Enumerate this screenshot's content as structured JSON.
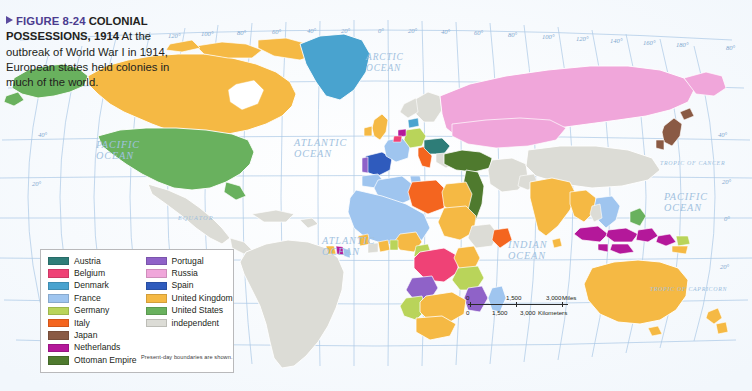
{
  "caption": {
    "figure_marker": "FIGURE 8-24",
    "title": "COLONIAL POSSESSIONS, 1914",
    "body": "At the outbreak of World War I in 1914, European states held colonies in much of the world."
  },
  "legend": {
    "note": "Present-day boundaries are shown.",
    "column_left": [
      {
        "label": "Austria",
        "color": "#2e7d78"
      },
      {
        "label": "Belgium",
        "color": "#ef4276"
      },
      {
        "label": "Denmark",
        "color": "#49a3cf"
      },
      {
        "label": "France",
        "color": "#9fc5ef"
      },
      {
        "label": "Germany",
        "color": "#b9d45a"
      },
      {
        "label": "Italy",
        "color": "#f4651f"
      },
      {
        "label": "Japan",
        "color": "#8a5a44"
      },
      {
        "label": "Netherlands",
        "color": "#b4189a"
      },
      {
        "label": "Ottoman Empire",
        "color": "#4f7a2e"
      }
    ],
    "column_right": [
      {
        "label": "Portugal",
        "color": "#8f62c8"
      },
      {
        "label": "Russia",
        "color": "#f0a6da"
      },
      {
        "label": "Spain",
        "color": "#2f5bbd"
      },
      {
        "label": "United Kingdom",
        "color": "#f5b944"
      },
      {
        "label": "United States",
        "color": "#69b15e"
      },
      {
        "label": "independent",
        "color": "#dcdcd6"
      }
    ]
  },
  "scale_bar": {
    "miles": {
      "ticks": [
        "0",
        "1,500",
        "3,000"
      ],
      "unit": "Miles"
    },
    "kilometers": {
      "ticks": [
        "0",
        "1,500",
        "3,000"
      ],
      "unit": "Kilometers"
    }
  },
  "ocean_labels": [
    {
      "id": "arctic",
      "lines": "ARCTIC OCEAN"
    },
    {
      "id": "pacific_nw",
      "lines": "PACIFIC OCEAN"
    },
    {
      "id": "atlantic_n",
      "lines": "ATLANTIC OCEAN"
    },
    {
      "id": "atlantic_s",
      "lines": "ATLANTIC OCEAN"
    },
    {
      "id": "indian",
      "lines": "INDIAN OCEAN"
    },
    {
      "id": "pacific_se",
      "lines": "PACIFIC OCEAN"
    }
  ],
  "ocean_text": {
    "arctic_l1": "ARCTIC",
    "arctic_l2": "OCEAN",
    "pacific_nw_l1": "PACIFIC",
    "pacific_nw_l2": "OCEAN",
    "atlantic_n_l1": "ATLANTIC",
    "atlantic_n_l2": "OCEAN",
    "atlantic_s_l1": "ATLANTIC",
    "atlantic_s_l2": "OCEAN",
    "indian_l1": "INDIAN",
    "indian_l2": "OCEAN",
    "pacific_se_l1": "PACIFIC",
    "pacific_se_l2": "OCEAN"
  },
  "reference_lines": {
    "equator": "EQUATOR",
    "tropic_cancer": "TROPIC OF CANCER",
    "tropic_capricorn": "TROPIC OF CAPRICORN"
  },
  "graticule": {
    "longitude_top": [
      "140°",
      "120°",
      "100°",
      "80°",
      "60°",
      "40°",
      "20°",
      "0°",
      "20°",
      "40°",
      "60°",
      "80°",
      "100°",
      "120°",
      "140°",
      "160°",
      "180°"
    ],
    "latitude_left": [
      "40°",
      "20°"
    ],
    "latitude_right": [
      "80°",
      "40°",
      "20°",
      "0°",
      "20°"
    ]
  },
  "colors": {
    "ocean_fill": "#ffffff",
    "graticule_line": "#9dc0e2",
    "coast_line": "#ffffff",
    "caption_accent": "#4b3c8f",
    "border_gray": "#b9b9bb"
  }
}
